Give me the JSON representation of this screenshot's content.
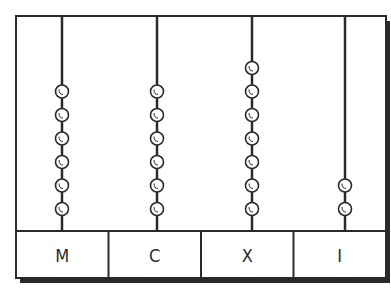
{
  "diagram": {
    "type": "abacus",
    "frame": {
      "x": 16,
      "y": 16,
      "width": 370,
      "height": 262,
      "label_row_top": 231
    },
    "colors": {
      "line": "#2a2a2a",
      "bead_fill": "#ffffff",
      "background": "#ffffff"
    },
    "columns": [
      {
        "label": "M",
        "rod_x": 62,
        "beads": 6
      },
      {
        "label": "C",
        "rod_x": 157,
        "beads": 6
      },
      {
        "label": "X",
        "rod_x": 252,
        "beads": 7
      },
      {
        "label": "I",
        "rod_x": 345,
        "beads": 2
      }
    ]
  }
}
